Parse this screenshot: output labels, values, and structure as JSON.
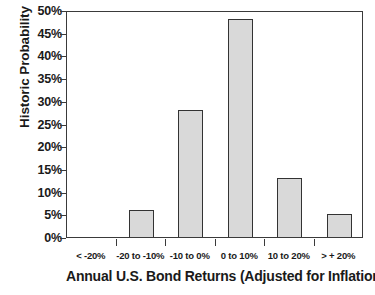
{
  "chart_data": {
    "type": "bar",
    "title": "",
    "xlabel": "Annual U.S. Bond Returns (Adjusted for Inflation)",
    "ylabel": "Historic Probability",
    "categories": [
      "< -20%",
      "-20 to -10%",
      "-10 to 0%",
      "0 to 10%",
      "10 to 20%",
      "> + 20%"
    ],
    "values": [
      0,
      6,
      28,
      48,
      13,
      5
    ],
    "value_labels": [
      "0%",
      "6%",
      "28%",
      "48%",
      "13%",
      "5%"
    ],
    "ylim": [
      0,
      50
    ],
    "ytick_values": [
      0,
      5,
      10,
      15,
      20,
      25,
      30,
      35,
      40,
      45,
      50
    ],
    "ytick_labels": [
      "0%",
      "5%",
      "10%",
      "15%",
      "20%",
      "25%",
      "30%",
      "35%",
      "40%",
      "45%",
      "50%"
    ],
    "grid": false,
    "legend": "none",
    "bar_fill_color": "#d9d9d9",
    "bar_edge_color": "#333333",
    "axis_color": "#3a3a3a",
    "text_color": "#1a1a1a",
    "background_color": "#ffffff"
  }
}
